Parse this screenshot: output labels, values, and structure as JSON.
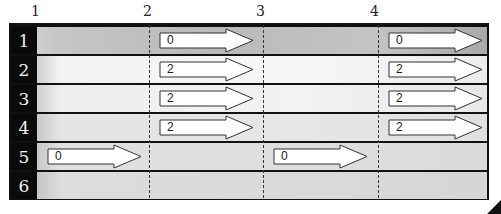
{
  "column_labels": [
    "1",
    "2",
    "3",
    "4"
  ],
  "rows": [
    {
      "label": "1"
    },
    {
      "label": "2"
    },
    {
      "label": "3"
    },
    {
      "label": "4"
    },
    {
      "label": "5"
    },
    {
      "label": "6"
    }
  ],
  "arrows": [
    {
      "row": 1,
      "col": 2,
      "value": "0"
    },
    {
      "row": 1,
      "col": 4,
      "value": "0"
    },
    {
      "row": 2,
      "col": 2,
      "value": "2"
    },
    {
      "row": 2,
      "col": 4,
      "value": "2"
    },
    {
      "row": 3,
      "col": 2,
      "value": "2"
    },
    {
      "row": 3,
      "col": 4,
      "value": "2"
    },
    {
      "row": 4,
      "col": 2,
      "value": "2"
    },
    {
      "row": 4,
      "col": 4,
      "value": "2"
    },
    {
      "row": 5,
      "col": 1,
      "value": "0"
    },
    {
      "row": 5,
      "col": 3,
      "value": "0"
    }
  ],
  "colors": {
    "frame": "#111111",
    "arrow_fill": "#ffffff",
    "arrow_stroke": "#333333"
  }
}
